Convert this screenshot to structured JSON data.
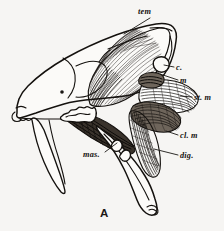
{
  "figure": {
    "figure_label": "A",
    "background_color": "#f6f5f3",
    "ink_color": "#14110e",
    "labels": [
      {
        "id": "tem",
        "text": "tem",
        "meaning": "temporalis muscle",
        "x": 138,
        "y": 14,
        "anchor": "start",
        "leader": "M150,18 L124,34"
      },
      {
        "id": "c",
        "text": "c.",
        "meaning": "condyle",
        "x": 176,
        "y": 70,
        "anchor": "start",
        "leader": "M174,67 L163,65"
      },
      {
        "id": "m",
        "text": "m",
        "meaning": "masseter insertion",
        "x": 180,
        "y": 83,
        "anchor": "start",
        "leader": "M178,80 L160,74"
      },
      {
        "id": "st-m",
        "text": "st. m",
        "meaning": "stylomastoid muscle",
        "x": 194,
        "y": 100,
        "anchor": "start",
        "leader": "M192,97 L181,96"
      },
      {
        "id": "cl-m",
        "text": "cl. m",
        "meaning": "cleidomastoid muscle",
        "x": 180,
        "y": 138,
        "anchor": "start",
        "leader": "M178,135 L166,132"
      },
      {
        "id": "dig",
        "text": "dig.",
        "meaning": "digastric muscle",
        "x": 180,
        "y": 158,
        "anchor": "start",
        "leader": "M178,155 L156,150"
      },
      {
        "id": "mas",
        "text": "mas.",
        "meaning": "masseter muscle",
        "x": 83,
        "y": 157,
        "anchor": "start",
        "leader": "M104,152 L116,142"
      }
    ]
  }
}
